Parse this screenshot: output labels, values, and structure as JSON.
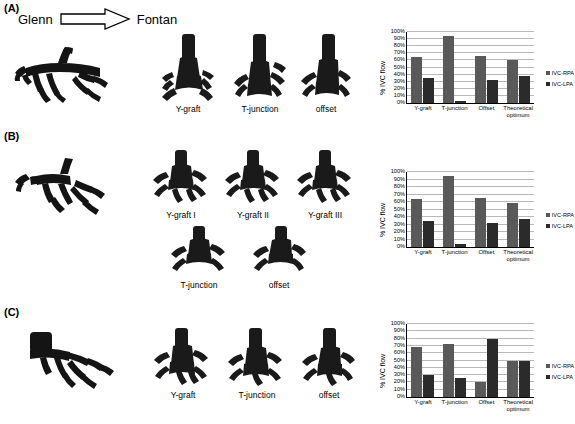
{
  "figure": {
    "panels": [
      {
        "letter": "(A)",
        "header": {
          "from": "Glenn",
          "to": "Fontan",
          "arrow_icon": "block-arrow-right-icon"
        },
        "models": [
          {
            "label": "",
            "name": "glenn-model"
          },
          {
            "label": "Y-graft",
            "name": "y-graft-model"
          },
          {
            "label": "T-junction",
            "name": "t-junction-model"
          },
          {
            "label": "offset",
            "name": "offset-model"
          }
        ]
      },
      {
        "letter": "(B)",
        "header": null,
        "models": [
          {
            "label": "",
            "name": "glenn-model"
          },
          {
            "label": "Y-graft I",
            "name": "y-graft-i-model"
          },
          {
            "label": "Y-graft II",
            "name": "y-graft-ii-model"
          },
          {
            "label": "Y-graft III",
            "name": "y-graft-iii-model"
          },
          {
            "label": "T-junction",
            "name": "t-junction-model"
          },
          {
            "label": "offset",
            "name": "offset-model"
          }
        ]
      },
      {
        "letter": "(C)",
        "header": null,
        "models": [
          {
            "label": "",
            "name": "glenn-model"
          },
          {
            "label": "Y-graft",
            "name": "y-graft-model"
          },
          {
            "label": "T-junction",
            "name": "t-junction-model"
          },
          {
            "label": "offset",
            "name": "offset-model"
          }
        ]
      }
    ]
  },
  "colors": {
    "rpa": "#595959",
    "lpa": "#2b2b2b",
    "gridline": "#b9b9b9",
    "axis": "#000000"
  },
  "chart_data": [
    {
      "type": "bar",
      "panel": "A",
      "title": "",
      "xlabel": "",
      "ylabel": "% IVC flow",
      "ylim": [
        0,
        100
      ],
      "ytick_labels": [
        "0%",
        "10%",
        "20%",
        "30%",
        "40%",
        "50%",
        "60%",
        "70%",
        "80%",
        "90%",
        "100%"
      ],
      "grid": true,
      "legend_position": "right",
      "categories": [
        "Y-graft",
        "T-junction",
        "Offset",
        "Theoretical optimum"
      ],
      "series": [
        {
          "name": "IVC-RPA",
          "values": [
            65,
            95,
            66,
            60
          ]
        },
        {
          "name": "IVC-LPA",
          "values": [
            35,
            3,
            32,
            38
          ]
        }
      ]
    },
    {
      "type": "bar",
      "panel": "B",
      "title": "",
      "xlabel": "",
      "ylabel": "% IVC flow",
      "ylim": [
        0,
        100
      ],
      "ytick_labels": [
        "0%",
        "10%",
        "20%",
        "30%",
        "40%",
        "50%",
        "60%",
        "70%",
        "80%",
        "90%",
        "100%"
      ],
      "grid": true,
      "legend_position": "right",
      "categories": [
        "Y-graft",
        "T-junction",
        "Offset",
        "Theoretical optimum"
      ],
      "series": [
        {
          "name": "IVC-RPA",
          "values": [
            64,
            95,
            65,
            59
          ]
        },
        {
          "name": "IVC-LPA",
          "values": [
            35,
            4,
            32,
            38
          ]
        }
      ]
    },
    {
      "type": "bar",
      "panel": "C",
      "title": "",
      "xlabel": "",
      "ylabel": "% IVC flow",
      "ylim": [
        0,
        100
      ],
      "ytick_labels": [
        "0%",
        "10%",
        "20%",
        "30%",
        "40%",
        "50%",
        "60%",
        "70%",
        "80%",
        "90%",
        "100%"
      ],
      "grid": true,
      "legend_position": "right",
      "categories": [
        "Y-graft",
        "T-junction",
        "Offset",
        "Theoretical optimum"
      ],
      "series": [
        {
          "name": "IVC-RPA",
          "values": [
            69,
            72,
            20,
            50
          ]
        },
        {
          "name": "IVC-LPA",
          "values": [
            30,
            26,
            79,
            50
          ]
        }
      ]
    }
  ]
}
